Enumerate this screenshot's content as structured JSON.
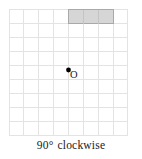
{
  "figure": {
    "type": "rotation-diagram",
    "caption": "90° clockwise",
    "caption_angle": "90°",
    "caption_direction": "clockwise",
    "center_label": "O"
  },
  "grid": {
    "columns": 8,
    "rows": 9,
    "cell_size": 14.1,
    "origin_x": 9,
    "origin_y": 9,
    "line_color": "#e3e3e3",
    "background": "#ffffff"
  },
  "shape": {
    "name": "shaded-rectangle",
    "col_start": 4,
    "col_span": 3,
    "row_start": 0,
    "row_span": 1,
    "fill": "#d6d6d6",
    "stroke": "#a9a9a9"
  },
  "center_point": {
    "name": "center-of-rotation",
    "col": 4,
    "row": 4.35,
    "x": 68,
    "y": 70,
    "color": "#000000",
    "radius": 2.4
  }
}
